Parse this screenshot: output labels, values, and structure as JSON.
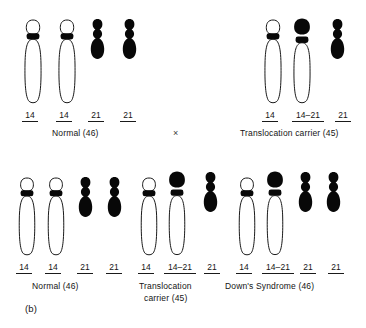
{
  "figure": {
    "panel_tag": "(b)",
    "cross_symbol": "×"
  },
  "groups": [
    {
      "id": "top-normal",
      "caption": "Normal (46)",
      "caption_line2": "",
      "chromosomes": [
        {
          "label": "14",
          "type": "chr14"
        },
        {
          "label": "14",
          "type": "chr14"
        },
        {
          "label": "21",
          "type": "chr21"
        },
        {
          "label": "21",
          "type": "chr21"
        }
      ]
    },
    {
      "id": "top-translocation",
      "caption": "Translocation carrier (45)",
      "caption_line2": "",
      "chromosomes": [
        {
          "label": "14",
          "type": "chr14"
        },
        {
          "label": "14–21",
          "type": "chr14-21"
        },
        {
          "label": "21",
          "type": "chr21"
        }
      ]
    },
    {
      "id": "bottom-normal",
      "caption": "Normal (46)",
      "caption_line2": "",
      "chromosomes": [
        {
          "label": "14",
          "type": "chr14"
        },
        {
          "label": "14",
          "type": "chr14"
        },
        {
          "label": "21",
          "type": "chr21"
        },
        {
          "label": "21",
          "type": "chr21"
        }
      ]
    },
    {
      "id": "bottom-translocation",
      "caption": "Translocation",
      "caption_line2": "carrier (45)",
      "chromosomes": [
        {
          "label": "14",
          "type": "chr14"
        },
        {
          "label": "14–21",
          "type": "chr14-21"
        },
        {
          "label": "21",
          "type": "chr21"
        }
      ]
    },
    {
      "id": "bottom-downs",
      "caption": "Down's  Syndrome (46)",
      "caption_line2": "",
      "chromosomes": [
        {
          "label": "14",
          "type": "chr14"
        },
        {
          "label": "14–21",
          "type": "chr14-21"
        },
        {
          "label": "21",
          "type": "chr21"
        },
        {
          "label": "21",
          "type": "chr21"
        }
      ]
    }
  ],
  "colors": {
    "ink": "#141414",
    "outline": "#1a1a1a",
    "solid": "#080808",
    "background": "#ffffff"
  }
}
